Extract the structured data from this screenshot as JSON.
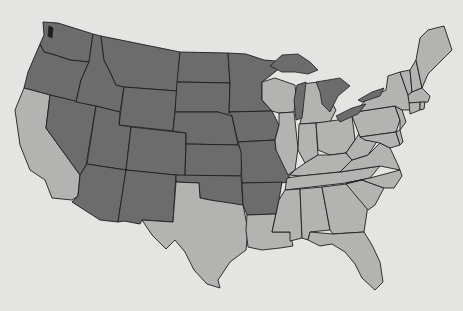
{
  "map": {
    "title": "",
    "region": "Contiguous United States",
    "legend": null,
    "colors": {
      "background": "#e4e4e2",
      "group_dark": "#6c6c6c",
      "group_light": "#b3b3b1",
      "borders": "#1e1e1e"
    },
    "groups": {
      "dark": [
        "Washington",
        "Oregon",
        "Idaho",
        "Montana",
        "Wyoming",
        "Nevada",
        "Utah",
        "Colorado",
        "Arizona",
        "New Mexico",
        "North Dakota",
        "South Dakota",
        "Nebraska",
        "Kansas",
        "Oklahoma",
        "Minnesota",
        "Iowa",
        "Missouri",
        "Arkansas"
      ],
      "light": [
        "California",
        "Texas",
        "Louisiana",
        "Wisconsin",
        "Illinois",
        "Michigan",
        "Indiana",
        "Ohio",
        "Kentucky",
        "Tennessee",
        "Mississippi",
        "Alabama",
        "Georgia",
        "Florida",
        "South Carolina",
        "North Carolina",
        "Virginia",
        "West Virginia",
        "Pennsylvania",
        "New York",
        "Maryland",
        "Delaware",
        "New Jersey",
        "Connecticut",
        "Rhode Island",
        "Massachusetts",
        "Vermont",
        "New Hampshire",
        "Maine"
      ]
    },
    "great_lakes_color": "dark"
  }
}
